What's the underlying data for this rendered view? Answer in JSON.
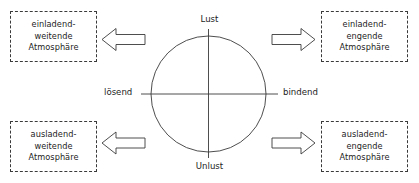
{
  "diagram": {
    "axes": {
      "top_label": "Lust",
      "bottom_label": "Unlust",
      "left_label": "lösend",
      "right_label": "bindend"
    },
    "colors": {
      "stroke": "#3a3a3a",
      "text": "#1d1d1d",
      "background": "#ffffff",
      "box_fill": "#ffffff"
    },
    "quadrants": [
      {
        "id": "top-left",
        "arrow_direction": "left",
        "lines": [
          "einladend-",
          "weitende",
          "Atmosphäre"
        ]
      },
      {
        "id": "top-right",
        "arrow_direction": "right",
        "lines": [
          "einladend-",
          "engende",
          "Atmosphäre"
        ]
      },
      {
        "id": "bottom-left",
        "arrow_direction": "left",
        "lines": [
          "ausladend-",
          "weitende",
          "Atmosphäre"
        ]
      },
      {
        "id": "bottom-right",
        "arrow_direction": "right",
        "lines": [
          "ausladend-",
          "engende",
          "Atmosphäre"
        ]
      }
    ],
    "icons": {
      "arrow_left": "arrow-left-icon",
      "arrow_right": "arrow-right-icon",
      "circle": "circle-shape",
      "axis_cross": "axis-cross-shape"
    }
  }
}
